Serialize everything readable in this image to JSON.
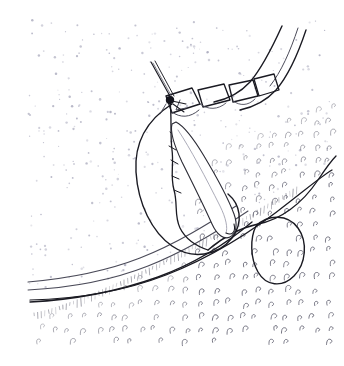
{
  "figure": {
    "caption": "",
    "medium": "pen-and-ink line drawing",
    "background_color": "#ffffff",
    "ink_color": "#1a1a22",
    "soft_ink_color": "#4a4a58",
    "hatch_color": "#5b5b6b",
    "stipple_color": "#9a9ab0",
    "canvas": {
      "width": 344,
      "height": 366
    },
    "content_bounds": {
      "x": 28,
      "y": 20,
      "width": 302,
      "height": 315
    }
  },
  "elements": {
    "upper_tissue_field": {
      "label": "upper tissue field",
      "texture": "stipple",
      "description": "lightly stippled pale tissue plane occupying the upper left two thirds"
    },
    "lower_tissue_field": {
      "label": "lower tissue field",
      "texture": "hook-hatching",
      "description": "dense field of small C-shaped hook strokes across the lower and right region"
    },
    "wound_edge": {
      "label": "wound edge",
      "description": "sweeping curve running from lower left to upper right separating the two tissue fields"
    },
    "band_curves": {
      "label": "banded tissue edge",
      "description": "pair of parallel curves descending from the top right corner"
    },
    "fascia_curves": {
      "label": "fascial plane curves",
      "description": "three nearly parallel sweeping curves crossing the lower left"
    },
    "stitch_row": {
      "label": "completed stitch row",
      "count": 4,
      "description": "four quadrilateral cross-stitch loops already tied along the upper wound edge"
    },
    "needle": {
      "label": "curved surgical needle",
      "description": "long tapered needle shaft passing obliquely through the tissue with rounded swage tip at lower right"
    },
    "suture_tail": {
      "label": "suture tail",
      "description": "short straight thread tail projecting up and to the left from the knot"
    },
    "knot": {
      "label": "suture knot",
      "description": "dark knot node where the tail meets the tissue"
    },
    "thread_loop_left": {
      "label": "suture thread loop",
      "description": "large rounded thread loop encircling the needle entry area"
    },
    "thread_loop_right": {
      "label": "suture thread free loop",
      "description": "small oval loop of free thread to the lower right"
    },
    "thread_run": {
      "label": "suture thread run",
      "description": "thread arcing from the needle toward the right margin"
    }
  }
}
